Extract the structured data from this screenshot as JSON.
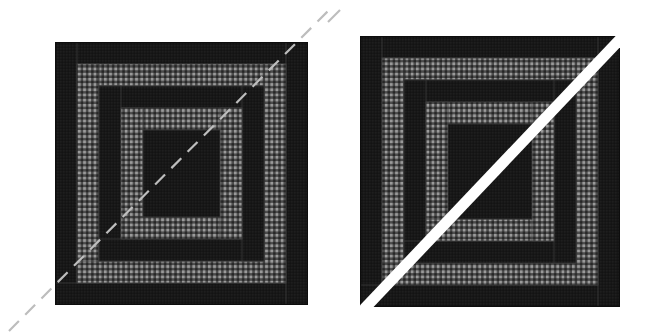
{
  "figure": {
    "background_color": "#ffffff",
    "width": 654,
    "height": 335
  },
  "colors": {
    "background": "#ffffff",
    "dark_fabric": "#181818",
    "dark_fabric_alt": "#1f1f1f",
    "gingham_base": "#2b2b2b",
    "gingham_light": "#8e8e8e",
    "gingham_mid": "#5a5a5a",
    "seam_line": "#3a3a3a",
    "guide_line": "#ffffff",
    "dashed_line": "#bdbdbd",
    "outline": "#0d0d0d"
  },
  "blocks": [
    {
      "id": "left-block",
      "name": "log-cabin-block-left",
      "label": "Left log cabin block",
      "x": 55,
      "y": 42,
      "width": 253,
      "height": 263,
      "orientation": "counter-clockwise",
      "guide": {
        "type": "dashed",
        "name": "dashed-diagonal-guide",
        "label": "Dashed diagonal cutting guide",
        "color": "#bdbdbd",
        "stroke_width": 2.2,
        "dash_pattern": "14 9",
        "x1": 9,
        "y1": 331,
        "x2": 333,
        "y2": 6
      },
      "strips": [
        {
          "name": "strip-01",
          "fabric": "dark",
          "x": 55,
          "y": 42,
          "w": 253,
          "h": 22
        },
        {
          "name": "strip-02",
          "fabric": "dark",
          "x": 55,
          "y": 42,
          "w": 22,
          "h": 263
        },
        {
          "name": "strip-03",
          "fabric": "dark",
          "x": 55,
          "y": 283,
          "w": 253,
          "h": 22
        },
        {
          "name": "strip-04",
          "fabric": "dark",
          "x": 286,
          "y": 42,
          "w": 22,
          "h": 263
        },
        {
          "name": "strip-05",
          "fabric": "gingham",
          "x": 77,
          "y": 64,
          "w": 209,
          "h": 22
        },
        {
          "name": "strip-06",
          "fabric": "gingham",
          "x": 77,
          "y": 64,
          "w": 22,
          "h": 219
        },
        {
          "name": "strip-07",
          "fabric": "gingham",
          "x": 77,
          "y": 261,
          "w": 209,
          "h": 22
        },
        {
          "name": "strip-08",
          "fabric": "gingham",
          "x": 264,
          "y": 64,
          "w": 22,
          "h": 219
        },
        {
          "name": "strip-09",
          "fabric": "dark",
          "x": 99,
          "y": 86,
          "w": 165,
          "h": 22
        },
        {
          "name": "strip-10",
          "fabric": "dark",
          "x": 99,
          "y": 86,
          "w": 22,
          "h": 175
        },
        {
          "name": "strip-11",
          "fabric": "dark",
          "x": 99,
          "y": 239,
          "w": 165,
          "h": 22
        },
        {
          "name": "strip-12",
          "fabric": "dark",
          "x": 242,
          "y": 86,
          "w": 22,
          "h": 175
        },
        {
          "name": "strip-13",
          "fabric": "gingham",
          "x": 121,
          "y": 108,
          "w": 121,
          "h": 22
        },
        {
          "name": "strip-14",
          "fabric": "gingham",
          "x": 121,
          "y": 108,
          "w": 22,
          "h": 131
        },
        {
          "name": "strip-15",
          "fabric": "gingham",
          "x": 121,
          "y": 217,
          "w": 121,
          "h": 22
        },
        {
          "name": "strip-16",
          "fabric": "gingham",
          "x": 220,
          "y": 108,
          "w": 22,
          "h": 131
        },
        {
          "name": "strip-17",
          "fabric": "dark",
          "x": 143,
          "y": 130,
          "w": 77,
          "h": 87
        }
      ]
    },
    {
      "id": "right-block",
      "name": "log-cabin-block-right",
      "label": "Right log cabin block",
      "x": 360,
      "y": 36,
      "width": 260,
      "height": 271,
      "orientation": "clockwise-mirrored",
      "guide": {
        "type": "solid-band",
        "name": "solid-diagonal-guide",
        "label": "Solid white diagonal sash",
        "color": "#ffffff",
        "stroke_width": 11,
        "x1": 347,
        "y1": 327,
        "x2": 627,
        "y2": 32
      },
      "strips": [
        {
          "name": "strip-01",
          "fabric": "dark",
          "x": 360,
          "y": 36,
          "w": 260,
          "h": 22
        },
        {
          "name": "strip-02",
          "fabric": "dark",
          "x": 360,
          "y": 36,
          "w": 22,
          "h": 271
        },
        {
          "name": "strip-03",
          "fabric": "dark",
          "x": 360,
          "y": 285,
          "w": 260,
          "h": 22
        },
        {
          "name": "strip-04",
          "fabric": "dark",
          "x": 598,
          "y": 36,
          "w": 22,
          "h": 271
        },
        {
          "name": "strip-05",
          "fabric": "gingham",
          "x": 382,
          "y": 58,
          "w": 216,
          "h": 22
        },
        {
          "name": "strip-06",
          "fabric": "gingham",
          "x": 382,
          "y": 58,
          "w": 22,
          "h": 227
        },
        {
          "name": "strip-07",
          "fabric": "gingham",
          "x": 382,
          "y": 263,
          "w": 216,
          "h": 22
        },
        {
          "name": "strip-08",
          "fabric": "gingham",
          "x": 576,
          "y": 58,
          "w": 22,
          "h": 227
        },
        {
          "name": "strip-09",
          "fabric": "dark",
          "x": 404,
          "y": 80,
          "w": 172,
          "h": 22
        },
        {
          "name": "strip-10",
          "fabric": "dark",
          "x": 404,
          "y": 80,
          "w": 22,
          "h": 183
        },
        {
          "name": "strip-11",
          "fabric": "dark",
          "x": 404,
          "y": 241,
          "w": 172,
          "h": 22
        },
        {
          "name": "strip-12",
          "fabric": "dark",
          "x": 554,
          "y": 80,
          "w": 22,
          "h": 183
        },
        {
          "name": "strip-13",
          "fabric": "gingham",
          "x": 426,
          "y": 102,
          "w": 128,
          "h": 22
        },
        {
          "name": "strip-14",
          "fabric": "gingham",
          "x": 426,
          "y": 102,
          "w": 22,
          "h": 139
        },
        {
          "name": "strip-15",
          "fabric": "gingham",
          "x": 426,
          "y": 219,
          "w": 128,
          "h": 22
        },
        {
          "name": "strip-16",
          "fabric": "gingham",
          "x": 532,
          "y": 102,
          "w": 22,
          "h": 139
        },
        {
          "name": "strip-17",
          "fabric": "dark",
          "x": 448,
          "y": 124,
          "w": 84,
          "h": 95
        }
      ]
    }
  ]
}
